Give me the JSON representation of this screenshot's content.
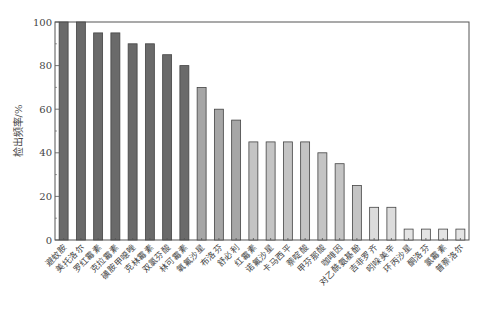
{
  "chart_data": {
    "type": "bar",
    "title": "",
    "xlabel": "",
    "ylabel": "检出频率/%",
    "ylim": [
      0,
      100
    ],
    "yticks": [
      0,
      20,
      40,
      60,
      80,
      100
    ],
    "grid": false,
    "legend": null,
    "categories": [
      "避蚊胺",
      "美托洛尔",
      "罗红霉素",
      "克拉霉素",
      "磺胺甲噁唑",
      "克林霉素",
      "双氯芬酸",
      "林可霉素",
      "氧氟沙星",
      "布洛芬",
      "舒必利",
      "红霉素",
      "诺氟沙星",
      "卡马西平",
      "萘啶酸",
      "甲芬那酸",
      "咖啡因",
      "对乙酰氨基酚",
      "吉非罗齐",
      "吲哚美辛",
      "环丙沙星",
      "酮洛芬",
      "氯霉素",
      "普萘洛尔"
    ],
    "values": [
      100,
      100,
      95,
      95,
      90,
      90,
      85,
      80,
      70,
      60,
      55,
      45,
      45,
      45,
      45,
      40,
      35,
      25,
      15,
      15,
      5,
      5,
      5,
      5
    ],
    "bar_colors": [
      "#6a6a6a",
      "#6a6a6a",
      "#6a6a6a",
      "#6a6a6a",
      "#6a6a6a",
      "#6a6a6a",
      "#6a6a6a",
      "#6a6a6a",
      "#a6a6a6",
      "#a6a6a6",
      "#a6a6a6",
      "#c4c4c4",
      "#c4c4c4",
      "#c4c4c4",
      "#c4c4c4",
      "#c4c4c4",
      "#c4c4c4",
      "#c4c4c4",
      "#dcdcdc",
      "#dcdcdc",
      "#e4e4e4",
      "#e4e4e4",
      "#e4e4e4",
      "#e4e4e4"
    ]
  }
}
